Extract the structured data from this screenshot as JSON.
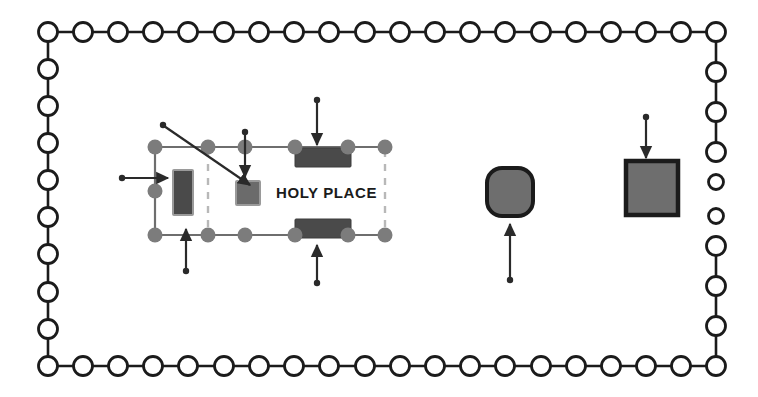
{
  "diagram": {
    "labels": {
      "holy_place": "HOLY PLACE"
    },
    "colors": {
      "background": "#ffffff",
      "outline": "#1b1b1b",
      "pillar_node": "#7c7c7c",
      "wall_line": "#6e6e6e",
      "furniture_dark": "#4a4a4a",
      "furniture_gray": "#7a7a7a",
      "veil_dashed": "#b8b8b8",
      "arrow": "#2a2a2a"
    },
    "courtyard": {
      "name": "courtyard-perimeter",
      "post_count_top": 20,
      "post_count_bottom": 20,
      "post_count_left": 10,
      "post_count_right": 10,
      "gate_gap_side": "right",
      "post_radius": 9.5,
      "gate_post_radius": 7.5,
      "bounds": {
        "x": 48,
        "y": 32,
        "width": 668,
        "height": 334
      }
    },
    "structure": {
      "name": "tabernacle-tent",
      "bounds": {
        "x": 155,
        "y": 147,
        "width": 230,
        "height": 88
      },
      "compartments": [
        {
          "name": "most-holy-place",
          "label": ""
        },
        {
          "name": "holy-place",
          "label": "HOLY PLACE"
        }
      ]
    },
    "furniture": [
      {
        "name": "ark-of-the-covenant",
        "shape": "rect-vertical",
        "x": 173,
        "y": 170,
        "width": 20,
        "height": 45,
        "fill": "#4a4a4a"
      },
      {
        "name": "altar-of-incense",
        "shape": "rect",
        "x": 236,
        "y": 181,
        "width": 24,
        "height": 24,
        "fill": "#6b6b6b"
      },
      {
        "name": "table-of-showbread",
        "shape": "bar",
        "x": 295,
        "y": 148,
        "width": 56,
        "height": 19,
        "fill": "#4a4a4a"
      },
      {
        "name": "lampstand",
        "shape": "bar",
        "x": 295,
        "y": 219,
        "width": 56,
        "height": 19,
        "fill": "#4a4a4a"
      },
      {
        "name": "laver",
        "shape": "squircle",
        "x": 487,
        "y": 168,
        "width": 46,
        "height": 48,
        "fill": "#6e6e6e"
      },
      {
        "name": "altar-of-burnt-offering",
        "shape": "square",
        "x": 626,
        "y": 161,
        "width": 52,
        "height": 54,
        "fill": "#6e6e6e"
      }
    ],
    "pointers": [
      {
        "name": "pointer-ark",
        "type": "diagonal",
        "from": [
          163,
          125
        ],
        "to": [
          251,
          186
        ]
      },
      {
        "name": "pointer-altar-of-incense",
        "type": "vertical-down",
        "from": [
          245,
          132
        ],
        "to": [
          245,
          178
        ]
      },
      {
        "name": "pointer-table-of-showbread",
        "type": "vertical-down",
        "from": [
          317,
          100
        ],
        "to": [
          317,
          144
        ]
      },
      {
        "name": "pointer-lampstand",
        "type": "vertical-up",
        "from": [
          317,
          283
        ],
        "to": [
          317,
          243
        ]
      },
      {
        "name": "pointer-most-holy-place",
        "type": "horizontal-right",
        "from": [
          122,
          178
        ],
        "to": [
          169,
          178
        ]
      },
      {
        "name": "pointer-court-entrance",
        "type": "vertical-up",
        "from": [
          186,
          271
        ],
        "to": [
          186,
          228
        ]
      },
      {
        "name": "pointer-laver",
        "type": "vertical-up",
        "from": [
          510,
          280
        ],
        "to": [
          510,
          222
        ]
      },
      {
        "name": "pointer-altar-of-burnt-offering",
        "type": "vertical-down",
        "from": [
          646,
          117
        ],
        "to": [
          646,
          157
        ]
      }
    ]
  }
}
